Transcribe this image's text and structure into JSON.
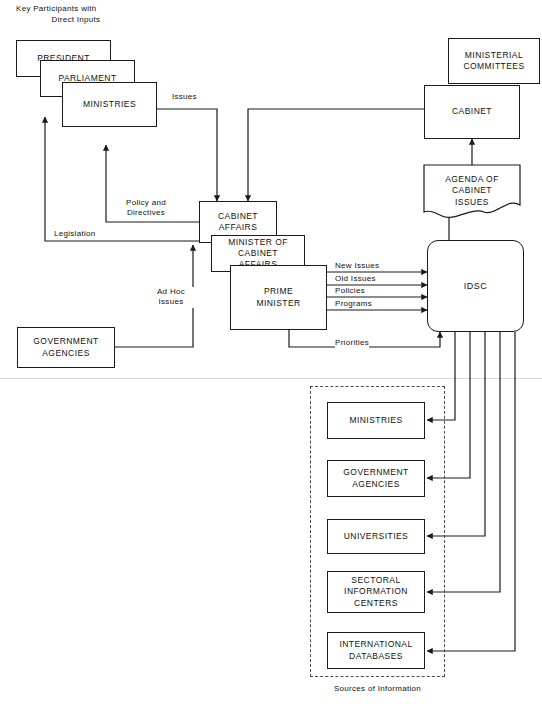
{
  "diagram": {
    "title_note": "Key Participants with Direct Inputs",
    "bottom_caption": "Sources of Information",
    "colors": {
      "stroke": "#1a1a1a",
      "dashed_stroke": "#4a4a4a",
      "background": "#ffffff",
      "divider": "#d8d8d8"
    }
  },
  "nodes": {
    "president": "PRESIDENT",
    "parliament": "PARLIAMENT",
    "ministries_top": "MINISTRIES",
    "cabinet_affairs": "CABINET\nAFFAIRS",
    "cabinet_affairs_l1": "CABINET",
    "cabinet_affairs_l2": "AFFAIRS",
    "minister_of_cabinet_affairs_l1": "MINISTER OF",
    "minister_of_cabinet_affairs_l2": "CABINET AFFAIRS",
    "prime_minister_l1": "PRIME",
    "prime_minister_l2": "MINISTER",
    "government_agencies_l1": "GOVERNMENT",
    "government_agencies_l2": "AGENCIES",
    "ministerial_committees_l1": "MINISTERIAL",
    "ministerial_committees_l2": "COMMITTEES",
    "cabinet": "CABINET",
    "agenda_l1": "AGENDA OF",
    "agenda_l2": "CABINET",
    "agenda_l3": "ISSUES",
    "idsc": "IDSC",
    "src_ministries": "MINISTRIES",
    "src_government_agencies_l1": "GOVERNMENT",
    "src_government_agencies_l2": "AGENCIES",
    "src_universities": "UNIVERSITIES",
    "src_sectoral_l1": "SECTORAL",
    "src_sectoral_l2": "INFORMATION",
    "src_sectoral_l3": "CENTERS",
    "src_international_l1": "INTERNATIONAL",
    "src_international_l2": "DATABASES"
  },
  "labels": {
    "header_l1": "Key Participants with",
    "header_l2": "Direct Inputs",
    "issues": "Issues",
    "policy_and_directives_l1": "Policy and",
    "policy_and_directives_l2": "Directives",
    "legislation": "Legislation",
    "ad_hoc_issues_l1": "Ad Hoc",
    "ad_hoc_issues_l2": "Issues",
    "new_issues": "New Issues",
    "old_issues": "Old Issues",
    "policies": "Policies",
    "programs": "Programs",
    "priorities": "Priorities",
    "sources_of_information": "Sources of Information"
  },
  "flows": [
    {
      "from": "MINISTRIES",
      "to": "CABINET AFFAIRS",
      "label": "Issues"
    },
    {
      "from": "CABINET",
      "to": "CABINET AFFAIRS",
      "label": ""
    },
    {
      "from": "CABINET AFFAIRS",
      "to": "MINISTRIES",
      "label": "Policy and Directives"
    },
    {
      "from": "CABINET AFFAIRS",
      "to": "PRESIDENT / PARLIAMENT",
      "label": "Legislation"
    },
    {
      "from": "GOVERNMENT AGENCIES",
      "to": "CABINET AFFAIRS",
      "label": "Ad Hoc Issues"
    },
    {
      "from": "PRIME MINISTER",
      "to": "IDSC",
      "label": "New Issues"
    },
    {
      "from": "PRIME MINISTER",
      "to": "IDSC",
      "label": "Old Issues"
    },
    {
      "from": "PRIME MINISTER",
      "to": "IDSC",
      "label": "Policies"
    },
    {
      "from": "PRIME MINISTER",
      "to": "IDSC",
      "label": "Programs"
    },
    {
      "from": "PRIME MINISTER",
      "to": "IDSC",
      "label": "Priorities"
    },
    {
      "from": "IDSC",
      "to": "AGENDA OF CABINET ISSUES",
      "label": ""
    },
    {
      "from": "AGENDA OF CABINET ISSUES",
      "to": "CABINET",
      "label": ""
    },
    {
      "from": "IDSC",
      "to": "MINISTRIES (source)",
      "label": ""
    },
    {
      "from": "IDSC",
      "to": "GOVERNMENT AGENCIES (source)",
      "label": ""
    },
    {
      "from": "IDSC",
      "to": "UNIVERSITIES",
      "label": ""
    },
    {
      "from": "IDSC",
      "to": "SECTORAL INFORMATION CENTERS",
      "label": ""
    },
    {
      "from": "IDSC",
      "to": "INTERNATIONAL DATABASES",
      "label": ""
    }
  ]
}
